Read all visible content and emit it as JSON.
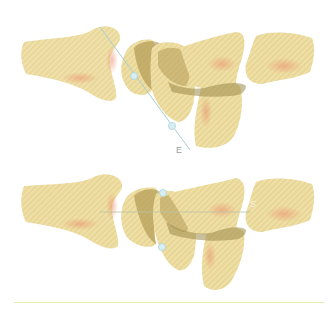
{
  "figure": {
    "panels": [
      {
        "id": "top",
        "label": "E",
        "axis_line": {
          "x1": 100,
          "y1": 27,
          "x2": 190,
          "y2": 150
        },
        "markers": [
          {
            "x": 134,
            "y": 76
          },
          {
            "x": 172,
            "y": 126
          }
        ],
        "label_pos": {
          "x": 176,
          "y": 145
        }
      },
      {
        "id": "bottom",
        "label": "S",
        "axis_line": {
          "x1": 100,
          "y1": 212,
          "x2": 250,
          "y2": 212
        },
        "markers": [
          {
            "x": 163,
            "y": 193
          },
          {
            "x": 162,
            "y": 247
          }
        ],
        "label_pos": {
          "x": 250,
          "y": 199
        }
      }
    ],
    "colors": {
      "bone_fill": "#eedca2",
      "bone_shadow": "#e9a77f",
      "bone_dark": "#b59a52",
      "overlap": "#9b8a4a",
      "line": "#a9cfd0",
      "marker": "#d8eef2",
      "marker_edge": "#a9d3db",
      "bottom_rule": "#e4ecb0"
    }
  }
}
